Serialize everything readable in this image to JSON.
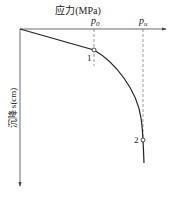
{
  "diagram": {
    "x_axis_title": "应力(MPa)",
    "y_axis_title": "沉降 s(cm)",
    "x_markers": [
      {
        "symbol": "p",
        "subscript": "0"
      },
      {
        "symbol": "p",
        "subscript": "u"
      }
    ],
    "points": [
      {
        "label": "1"
      },
      {
        "label": "2"
      }
    ],
    "colors": {
      "line": "#222222",
      "dashed": "#555555",
      "background": "#ffffff"
    }
  }
}
